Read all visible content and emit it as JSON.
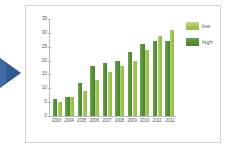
{
  "nav": {
    "arrow_icon": "play-triangle-right-icon",
    "arrow_color": "#2e5b92"
  },
  "legend": {
    "position": "top-right",
    "entries": [
      {
        "label": "low",
        "color": "#9cc44e"
      },
      {
        "label": "high",
        "color": "#4b8333"
      }
    ]
  },
  "chart_data": {
    "type": "bar",
    "title": "",
    "subtitle": "",
    "xlabel": "",
    "ylabel": "",
    "grid": false,
    "ylim": [
      0,
      35
    ],
    "yticks": [
      0,
      5,
      10,
      15,
      20,
      25,
      30,
      35
    ],
    "categories": [
      "2003",
      "2004",
      "2005",
      "2006",
      "2007",
      "2008",
      "2009",
      "2010",
      "2011",
      "2012"
    ],
    "series": [
      {
        "name": "high",
        "color": "#4b8333",
        "values": [
          6,
          7,
          12,
          18,
          19,
          20,
          23,
          26,
          27,
          27
        ]
      },
      {
        "name": "low",
        "color": "#9cc44e",
        "values": [
          5,
          7,
          9,
          13,
          16,
          18,
          20,
          24,
          29,
          31
        ]
      }
    ]
  }
}
